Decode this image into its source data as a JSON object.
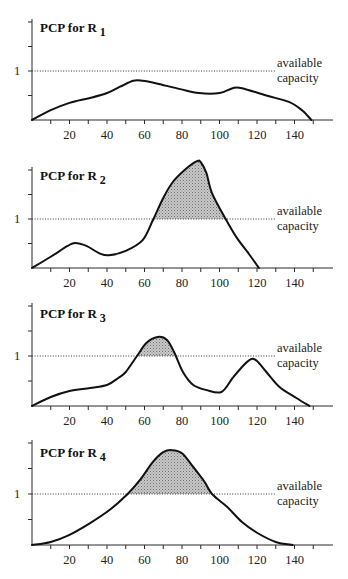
{
  "figure": {
    "capacity_label": [
      "available",
      "capacity"
    ],
    "colors": {
      "curve": "#111111",
      "axis": "#2a2a2a",
      "overload_fill": "#c9c9c9",
      "overload_dots": "#6e6e6e"
    }
  },
  "chart_data": [
    {
      "type": "line",
      "title": "PCP for R 1",
      "title_main": "PCP for R",
      "title_subscript": "1",
      "xlabel": "",
      "ylabel": "",
      "x_tick_labels": [
        "20",
        "40",
        "60",
        "80",
        "100",
        "120",
        "140"
      ],
      "x_ticks_every": 10,
      "y_tick_label": "1",
      "y_ticks": [
        0.5,
        1,
        1.5,
        2
      ],
      "xlim": [
        0,
        160
      ],
      "ylim": [
        0,
        2.06
      ],
      "grid": false,
      "capacity": 1,
      "annotation": "available capacity",
      "shaded_overload": false,
      "x": [
        0,
        10,
        20,
        31,
        40,
        47,
        54,
        59,
        66,
        79,
        89,
        100,
        107,
        112,
        125,
        137,
        144,
        149
      ],
      "y": [
        0,
        0.2,
        0.35,
        0.45,
        0.55,
        0.68,
        0.8,
        0.8,
        0.75,
        0.63,
        0.55,
        0.55,
        0.65,
        0.65,
        0.5,
        0.37,
        0.2,
        0
      ]
    },
    {
      "type": "line",
      "title": "PCP for R 2",
      "title_main": "PCP for R",
      "title_subscript": "2",
      "xlabel": "",
      "ylabel": "",
      "x_tick_labels": [
        "20",
        "40",
        "60",
        "80",
        "100",
        "120",
        "140"
      ],
      "x_ticks_every": 10,
      "y_tick_label": "1",
      "y_ticks": [
        0.5,
        1,
        1.5,
        2
      ],
      "xlim": [
        0,
        160
      ],
      "ylim": [
        0,
        2.06
      ],
      "grid": false,
      "capacity": 1,
      "annotation": "available capacity",
      "shaded_overload": true,
      "x": [
        0,
        10,
        19,
        23,
        29,
        36,
        41,
        50,
        59,
        64.5,
        70,
        75,
        82,
        88,
        90,
        93,
        96,
        103,
        109,
        116,
        121
      ],
      "y": [
        0,
        0.23,
        0.45,
        0.51,
        0.45,
        0.3,
        0.26,
        0.35,
        0.57,
        0.98,
        1.43,
        1.75,
        2.02,
        2.18,
        2.16,
        1.94,
        1.53,
        1.02,
        0.63,
        0.27,
        0
      ]
    },
    {
      "type": "line",
      "title": "PCP for R 3",
      "title_main": "PCP for R",
      "title_subscript": "3",
      "xlabel": "",
      "ylabel": "",
      "x_tick_labels": [
        "20",
        "40",
        "60",
        "80",
        "100",
        "120",
        "140"
      ],
      "x_ticks_every": 10,
      "y_tick_label": "1",
      "y_ticks": [
        0.5,
        1,
        1.5,
        2
      ],
      "xlim": [
        0,
        160
      ],
      "ylim": [
        0,
        2.06
      ],
      "grid": false,
      "capacity": 1,
      "annotation": "available capacity",
      "shaded_overload": true,
      "x": [
        0,
        10,
        20,
        31,
        40,
        46,
        50,
        56,
        61,
        67,
        72,
        76,
        80.5,
        86,
        93,
        101,
        107,
        113,
        117,
        120,
        125,
        132,
        141,
        148
      ],
      "y": [
        0,
        0.18,
        0.3,
        0.36,
        0.42,
        0.56,
        0.68,
        1.0,
        1.26,
        1.38,
        1.32,
        1.06,
        0.68,
        0.42,
        0.32,
        0.28,
        0.56,
        0.82,
        0.94,
        0.9,
        0.68,
        0.38,
        0.16,
        0
      ]
    },
    {
      "type": "line",
      "title": "PCP for R 4",
      "title_main": "PCP for R",
      "title_subscript": "4",
      "xlabel": "",
      "ylabel": "",
      "x_tick_labels": [
        "20",
        "40",
        "60",
        "80",
        "100",
        "120",
        "140"
      ],
      "x_ticks_every": 10,
      "y_tick_label": "1",
      "y_ticks": [
        0.5,
        1,
        1.5,
        2
      ],
      "xlim": [
        0,
        160
      ],
      "ylim": [
        0,
        2.06
      ],
      "grid": false,
      "capacity": 1,
      "annotation": "available capacity",
      "shaded_overload": true,
      "x": [
        0,
        10,
        20,
        31,
        41.5,
        51,
        57.5,
        64.5,
        70,
        74.5,
        80,
        86,
        92,
        96,
        104,
        112,
        120,
        130,
        139
      ],
      "y": [
        0,
        0.06,
        0.2,
        0.43,
        0.69,
        1.0,
        1.27,
        1.63,
        1.82,
        1.86,
        1.8,
        1.53,
        1.24,
        1.0,
        0.75,
        0.45,
        0.24,
        0.06,
        0
      ]
    }
  ]
}
